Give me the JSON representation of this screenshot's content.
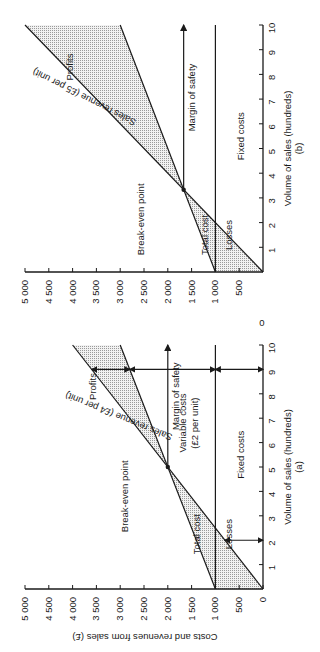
{
  "figure": {
    "orientation": "rotated-90-counterclockwise",
    "stray_mark": "0",
    "shared_y_axis_title": "Costs and revenues from sales (£)"
  },
  "chart_data": [
    {
      "panel": "(a)",
      "type": "line",
      "title": "",
      "caption": "(a)",
      "xlabel": "Volume of sales (hundreds)",
      "ylabel": "Costs and revenues from sales (£)",
      "xlim": [
        0,
        10
      ],
      "ylim": [
        0,
        5000
      ],
      "x_ticks": [
        "1",
        "2",
        "3",
        "4",
        "5",
        "6",
        "7",
        "8",
        "9",
        "10"
      ],
      "y_ticks": [
        "0",
        "500",
        "1 000",
        "1 500",
        "2 000",
        "2 500",
        "3 000",
        "3 500",
        "4 000",
        "4 500",
        "5 000"
      ],
      "grid": false,
      "series": [
        {
          "name": "Sales revenue (£4 per unit)",
          "x": [
            0,
            10
          ],
          "y": [
            0,
            4000
          ]
        },
        {
          "name": "Total cost",
          "x": [
            0,
            10
          ],
          "y": [
            1000,
            3000
          ]
        },
        {
          "name": "Fixed costs",
          "x": [
            0,
            10
          ],
          "y": [
            1000,
            1000
          ]
        }
      ],
      "annotations": {
        "break_even_point": {
          "label": "Break-even point",
          "x": 5,
          "y": 2000
        },
        "profits_label": "Profits",
        "losses_label": "Losses",
        "margin_of_safety": {
          "label": "Margin of safety",
          "from_x": 5,
          "to_x": 10
        },
        "variable_costs": {
          "label": "Variable costs",
          "sub_label": "(£2 per unit)",
          "at_x": 9,
          "from_y": 1000,
          "to_y": 2800
        },
        "fixed_costs_arrow_at_9": {
          "from_y": 0,
          "to_y": 1000
        },
        "fixed_costs_arrow_at_2": {
          "from_y": 0,
          "to_y": 800
        },
        "profit_arrow_at_9": {
          "from_y": 2800,
          "to_y": 3600
        },
        "fixed_costs_label": "Fixed costs"
      }
    },
    {
      "panel": "(b)",
      "type": "line",
      "title": "",
      "caption": "(b)",
      "xlabel": "Volume of sales (hundreds)",
      "ylabel": "Costs and revenues from sales (£)",
      "xlim": [
        0,
        10
      ],
      "ylim": [
        0,
        5000
      ],
      "x_ticks": [
        "1",
        "2",
        "3",
        "4",
        "5",
        "6",
        "7",
        "8",
        "9",
        "10"
      ],
      "y_ticks": [
        "500",
        "1 000",
        "1 500",
        "2 000",
        "2 500",
        "3 000",
        "3 500",
        "4 000",
        "4 500",
        "5 000"
      ],
      "grid": false,
      "series": [
        {
          "name": "Sales revenue (£5 per unit)",
          "x": [
            0,
            10
          ],
          "y": [
            0,
            5000
          ]
        },
        {
          "name": "Total cost",
          "x": [
            0,
            10
          ],
          "y": [
            1000,
            3000
          ]
        },
        {
          "name": "Fixed costs",
          "x": [
            0,
            10
          ],
          "y": [
            1000,
            1000
          ]
        }
      ],
      "annotations": {
        "break_even_point": {
          "label": "Break-even point",
          "x": 3.33,
          "y": 1667
        },
        "profits_label": "Profits",
        "losses_label": "Losses",
        "margin_of_safety": {
          "label": "Margin of safety",
          "from_x": 3.33,
          "to_x": 10
        },
        "fixed_costs_label": "Fixed costs"
      }
    }
  ]
}
